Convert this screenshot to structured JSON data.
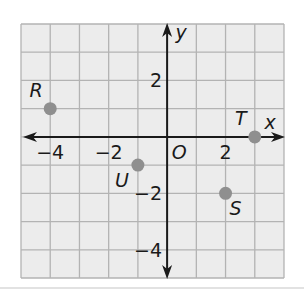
{
  "chart_data": {
    "type": "scatter",
    "title": "",
    "xlabel": "x",
    "ylabel": "y",
    "xlim": [
      -5,
      4
    ],
    "ylim": [
      -5,
      4
    ],
    "grid": true,
    "origin_label": "O",
    "x_ticks": [
      {
        "value": -4,
        "label": "−4"
      },
      {
        "value": -2,
        "label": "−2"
      },
      {
        "value": 2,
        "label": "2"
      }
    ],
    "y_ticks": [
      {
        "value": 2,
        "label": "2"
      },
      {
        "value": -2,
        "label": "−2"
      },
      {
        "value": -4,
        "label": "−4"
      }
    ],
    "points": [
      {
        "name": "R",
        "x": -4,
        "y": 1
      },
      {
        "name": "T",
        "x": 3,
        "y": 0
      },
      {
        "name": "U",
        "x": -1,
        "y": -1
      },
      {
        "name": "S",
        "x": 2,
        "y": -2
      }
    ]
  },
  "colors": {
    "grid_fill": "#ececec",
    "grid_line": "#b3b3b3",
    "axis": "#1a1a1a",
    "point": "#8f8f8f",
    "divider": "#d8d8d8"
  }
}
